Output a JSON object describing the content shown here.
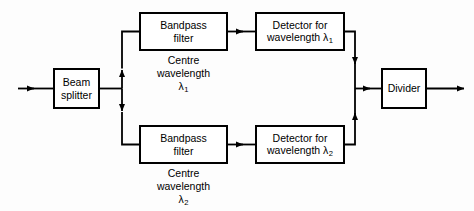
{
  "diagram": {
    "stroke_color": "#000000",
    "background_color": "#fdfdfd",
    "nodes": {
      "beam_splitter": {
        "line1": "Beam",
        "line2": "splitter"
      },
      "bandpass_top": {
        "line1": "Bandpass",
        "line2": "filter"
      },
      "bandpass_bottom": {
        "line1": "Bandpass",
        "line2": "filter"
      },
      "detector_top": {
        "line1": "Detector for",
        "line2_prefix": "wavelength ",
        "line2_symbol": "λ",
        "line2_subscript": "1"
      },
      "detector_bottom": {
        "line1": "Detector for",
        "line2_prefix": "wavelength ",
        "line2_symbol": "λ",
        "line2_subscript": "2"
      },
      "divider": {
        "label": "Divider"
      }
    },
    "captions": {
      "top": {
        "line1": "Centre",
        "line2": "wavelength",
        "symbol": "λ",
        "subscript": "1"
      },
      "bottom": {
        "line1": "Centre",
        "line2": "wavelength",
        "symbol": "λ",
        "subscript": "2"
      }
    },
    "signals": {
      "input_label": "optical input",
      "output_label": "ratio output"
    }
  }
}
